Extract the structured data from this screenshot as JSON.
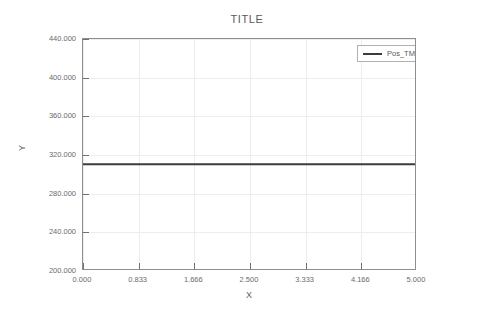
{
  "chart_data": {
    "type": "line",
    "title": "TITLE",
    "xlabel": "X",
    "ylabel": "Y",
    "xlim": [
      0,
      5
    ],
    "ylim": [
      200,
      440
    ],
    "grid": true,
    "legend_position": "upper right",
    "x_tick_labels": [
      "0.000",
      "0.833",
      "1.666",
      "2.500",
      "3.333",
      "4.166",
      "5.000"
    ],
    "x_ticks": [
      0,
      0.833,
      1.666,
      2.5,
      3.333,
      4.166,
      5
    ],
    "y_tick_labels": [
      "200.000",
      "240.000",
      "280.000",
      "320.000",
      "360.000",
      "400.000",
      "440.000"
    ],
    "y_ticks": [
      200,
      240,
      280,
      320,
      360,
      400,
      440
    ],
    "series": [
      {
        "name": "Pos_TM - Body1 (mm)",
        "color": "#3c3c3c",
        "x": [
          0,
          0.833,
          1.666,
          2.5,
          3.333,
          4.166,
          5
        ],
        "values": [
          310.5,
          310.5,
          310.5,
          310.5,
          310.5,
          310.5,
          310.5
        ]
      }
    ]
  },
  "legend": {
    "entries": [
      {
        "label": "Pos_TM - Body1 (mm)"
      }
    ]
  },
  "colors": {
    "series": "#3c3c3c",
    "grid": "#ededed",
    "axis": "#8e8e8e",
    "text": "#5a5a5a"
  }
}
